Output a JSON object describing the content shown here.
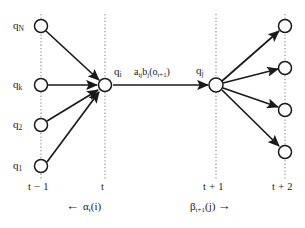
{
  "figure": {
    "type": "hmm-trellis-diagram",
    "background_color": "#ffffff",
    "stroke_color": "#1a1a1a",
    "node_fill": "#ffffff"
  },
  "columns": [
    {
      "id": "t-minus-1",
      "time_label": "t − 1",
      "x": 41
    },
    {
      "id": "t",
      "time_label": "t",
      "x": 105
    },
    {
      "id": "t-plus-1",
      "time_label": "t + 1",
      "x": 216
    },
    {
      "id": "t-plus-2",
      "time_label": "t + 2",
      "x": 285
    }
  ],
  "left_states": [
    {
      "label": "q",
      "sub": "N",
      "x": 41,
      "y": 26
    },
    {
      "label": "q",
      "sub": "k",
      "x": 41,
      "y": 85
    },
    {
      "label": "q",
      "sub": "2",
      "x": 41,
      "y": 125
    },
    {
      "label": "q",
      "sub": "1",
      "x": 41,
      "y": 166
    }
  ],
  "center_state": {
    "label": "q",
    "sub": "i",
    "x": 105,
    "y": 85
  },
  "next_state": {
    "label": "q",
    "sub": "j",
    "x": 216,
    "y": 85
  },
  "right_states": [
    {
      "x": 285,
      "y": 26
    },
    {
      "x": 285,
      "y": 68
    },
    {
      "x": 285,
      "y": 110
    },
    {
      "x": 285,
      "y": 152
    }
  ],
  "transition_formula": {
    "parts": [
      {
        "text": "a",
        "sub": "ij"
      },
      {
        "text": "b",
        "sub": "j"
      },
      {
        "text": "(o",
        "sub": "t+1"
      },
      {
        "text": ")",
        "sub": ""
      }
    ],
    "plain": "a_ij b_j(o_t+1)"
  },
  "alpha_annotation": {
    "arrow": "←",
    "symbol": "α",
    "sub": "t",
    "arg": "(i)",
    "plain": "← α_t(i)"
  },
  "beta_annotation": {
    "arrow": "→",
    "symbol": "β",
    "sub": "t+1",
    "arg": "(j)",
    "plain": "β_t+1(j) →"
  },
  "node_radius": 6.5
}
